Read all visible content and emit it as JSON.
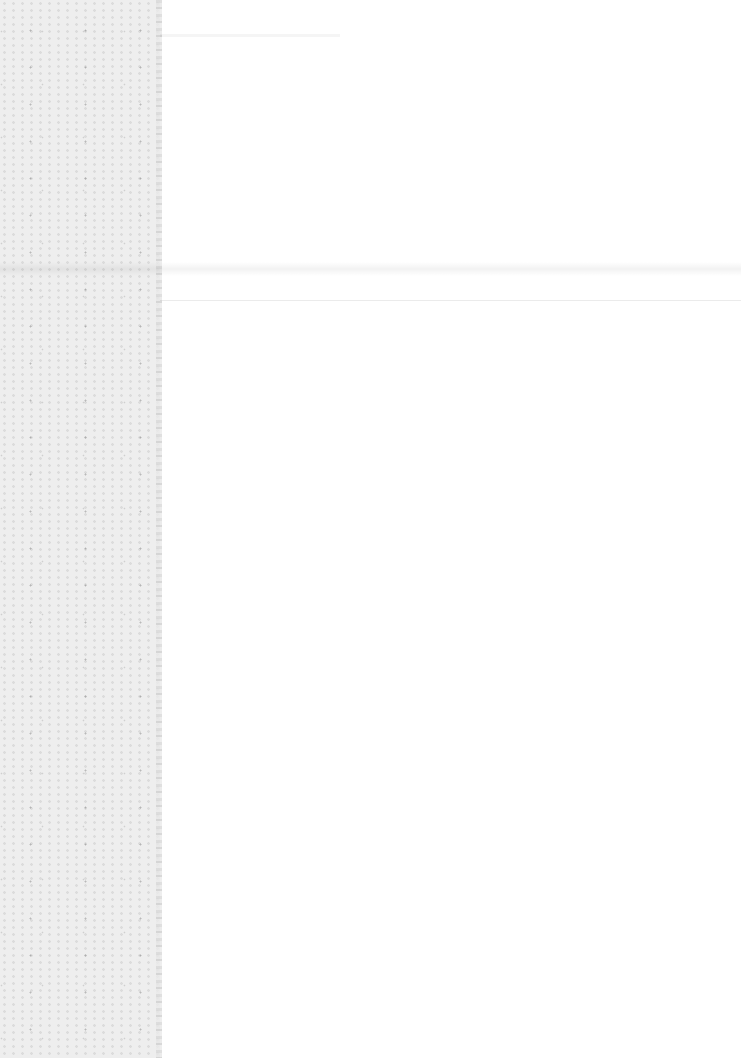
{
  "document": {
    "title": "",
    "body_text": "",
    "colors": {
      "paper": "#ffffff",
      "left_strip": "#eeeeee"
    }
  }
}
